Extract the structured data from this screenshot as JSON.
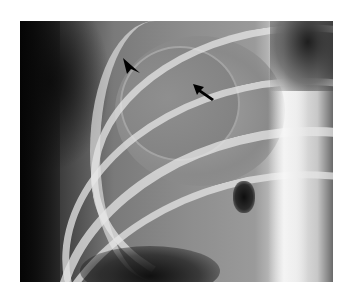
{
  "image": {
    "type": "chest-radiograph",
    "frame": {
      "x": 20,
      "y": 21,
      "width": 313,
      "height": 261
    },
    "background_color": "#ffffff"
  },
  "annotations": [
    {
      "name": "arrowhead-marker",
      "kind": "arrowhead",
      "direction": "down-right",
      "x": 123,
      "y": 58,
      "color": "#000000"
    },
    {
      "name": "arrow-marker",
      "kind": "arrow",
      "direction": "up-left",
      "x": 193,
      "y": 84,
      "color": "#000000"
    }
  ]
}
